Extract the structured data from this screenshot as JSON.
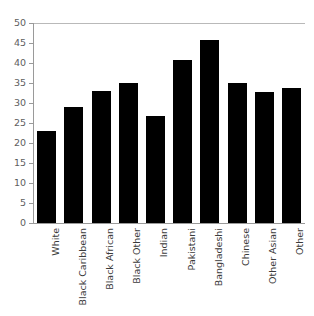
{
  "figure": {
    "top_fragment_text": "",
    "background_color": "#ffffff",
    "bar_color": "#000000",
    "axis_color": "#9a9a9a",
    "gridline_color": "#b9b9b9",
    "tick_label_color": "#5e5e5e",
    "x_label_color": "#3b3b3b"
  },
  "chart_data": {
    "type": "bar",
    "title": "",
    "xlabel": "",
    "ylabel": "",
    "categories": [
      "White",
      "Black Caribbean",
      "Black African",
      "Black Other",
      "Indian",
      "Pakistani",
      "Bangladeshi",
      "Chinese",
      "Other Asian",
      "Other"
    ],
    "values": [
      23.0,
      28.9,
      33.0,
      35.0,
      26.8,
      40.8,
      45.7,
      34.9,
      32.8,
      33.7
    ],
    "ylim": [
      0,
      50
    ],
    "yticks": [
      0,
      5,
      10,
      15,
      20,
      25,
      30,
      35,
      40,
      45,
      50
    ],
    "ytick_labels": [
      "0",
      "5",
      "10",
      "15",
      "20",
      "25",
      "30",
      "35",
      "40",
      "45",
      "50"
    ],
    "grid": false,
    "top_rule_at": 50,
    "legend": null,
    "legend_position": "none",
    "orientation": "vertical",
    "bar_color": "#000000",
    "x_tick_label_rotation": 90
  }
}
